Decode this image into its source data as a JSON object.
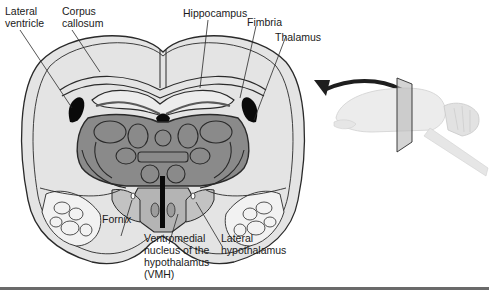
{
  "figure": {
    "type": "coronal brain section diagram",
    "orientation_inset": "sagittal view of whole brain with coronal cutting plane and arrow pointing to section"
  },
  "labels": {
    "lateral_ventricle": "Lateral\nventricle",
    "corpus_callosum": "Corpus\ncallosum",
    "hippocampus": "Hippocampus",
    "fimbria": "Fimbria",
    "thalamus": "Thalamus",
    "fornix": "Fornix",
    "vmh": "Ventromedial\nnucleus of the\nhypothalamus\n(VMH)",
    "lateral_hypothalamus": "Lateral\nhypothalamus"
  },
  "colors": {
    "outline": "#2a2a2a",
    "cortex_fill": "#e4e4e4",
    "thalamus_fill": "#8a8a8a",
    "hypothalamus_fill": "#b4b4b4",
    "ventricle_fill": "#0a0a0a",
    "inset_brain": "#e8e8e8",
    "rule": "#6a6a6a"
  }
}
